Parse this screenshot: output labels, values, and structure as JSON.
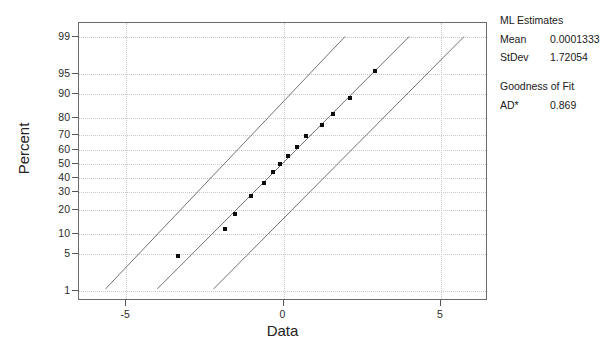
{
  "chart_data": {
    "type": "scatter",
    "title": "",
    "xlabel": "Data",
    "ylabel": "Percent",
    "subtype": "normal-probability-plot",
    "grid": true,
    "xlim": [
      -6.5,
      6.5
    ],
    "ylim_percent": [
      0.6,
      99.5
    ],
    "xticks": [
      -5,
      0,
      5
    ],
    "xtick_labels": [
      "-5",
      "0",
      "5"
    ],
    "yticks": [
      1,
      5,
      10,
      20,
      30,
      40,
      50,
      60,
      70,
      80,
      90,
      95,
      99
    ],
    "ytick_labels": [
      "1",
      "5",
      "10",
      "20",
      "30",
      "40",
      "50",
      "60",
      "70",
      "80",
      "90",
      "95",
      "99"
    ],
    "points": [
      {
        "x": -3.35,
        "y_percent": 4.5
      },
      {
        "x": -1.85,
        "y_percent": 11.5
      },
      {
        "x": -1.55,
        "y_percent": 18.0
      },
      {
        "x": -1.05,
        "y_percent": 27.5
      },
      {
        "x": -0.62,
        "y_percent": 36.5
      },
      {
        "x": -0.35,
        "y_percent": 44.0
      },
      {
        "x": -0.12,
        "y_percent": 50.0
      },
      {
        "x": 0.15,
        "y_percent": 55.5
      },
      {
        "x": 0.42,
        "y_percent": 62.0
      },
      {
        "x": 0.72,
        "y_percent": 69.5
      },
      {
        "x": 1.22,
        "y_percent": 76.0
      },
      {
        "x": 1.58,
        "y_percent": 82.0
      },
      {
        "x": 2.12,
        "y_percent": 88.5
      },
      {
        "x": 2.92,
        "y_percent": 95.5
      }
    ],
    "fit_line": {
      "name": "ML fit line",
      "from": {
        "x": -4.0,
        "y_percent": 1.0
      },
      "to": {
        "x": 4.05,
        "y_percent": 99.0
      }
    },
    "confidence_bands": [
      {
        "name": "upper confidence bound",
        "from": {
          "x": -5.65,
          "y_percent": 1.0
        },
        "to": {
          "x": 2.0,
          "y_percent": 99.0
        }
      },
      {
        "name": "lower confidence bound",
        "from": {
          "x": -2.2,
          "y_percent": 1.0
        },
        "to": {
          "x": 5.8,
          "y_percent": 99.0
        }
      }
    ],
    "colors": {
      "marker": "#0c0c0c",
      "line": "#707070",
      "grid": "#c8c8c8",
      "frame": "#6b6b6b",
      "text": "#202020"
    }
  },
  "legend": {
    "ml_header": "ML Estimates",
    "rows": [
      {
        "key": "Mean",
        "value": "0.0001333"
      },
      {
        "key": "StDev",
        "value": "1.72054"
      }
    ],
    "gof_header": "Goodness of Fit",
    "gof_rows": [
      {
        "key": "AD*",
        "value": "0.869"
      }
    ]
  }
}
